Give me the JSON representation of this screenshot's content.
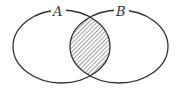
{
  "diagram": {
    "type": "venn",
    "sets": [
      {
        "label": "A"
      },
      {
        "label": "B"
      }
    ],
    "shaded_region": "A ∩ B",
    "shading": "diagonal-hatch",
    "colors": {
      "stroke": "#333333",
      "background": "#ffffff"
    }
  }
}
